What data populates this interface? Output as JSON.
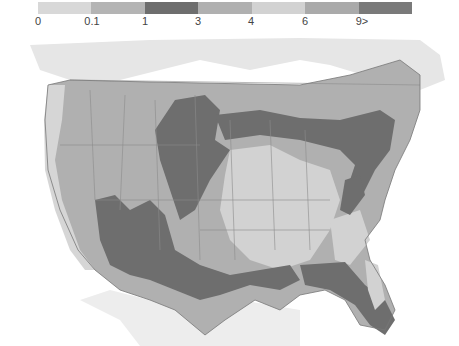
{
  "legend": {
    "segments": [
      {
        "label": "0",
        "color": "#d8d8d8"
      },
      {
        "label": "0.1",
        "color": "#b4b4b4"
      },
      {
        "label": "1",
        "color": "#6e6e6e"
      },
      {
        "label": "3",
        "color": "#b0b0b0"
      },
      {
        "label": "4",
        "color": "#d2d2d2"
      },
      {
        "label": "6",
        "color": "#aaaaaa"
      },
      {
        "label": "9>",
        "color": "#7a7a7a"
      }
    ]
  },
  "map": {
    "region": "Contiguous United States with southern Canada and northern Mexico",
    "colors": {
      "ocean": "#ffffff",
      "outside_land": "#e6e6e6",
      "level_low": "#d2d2d2",
      "level_mid": "#b0b0b0",
      "level_high": "#6e6e6e",
      "borders": "#8c8c8c"
    }
  }
}
